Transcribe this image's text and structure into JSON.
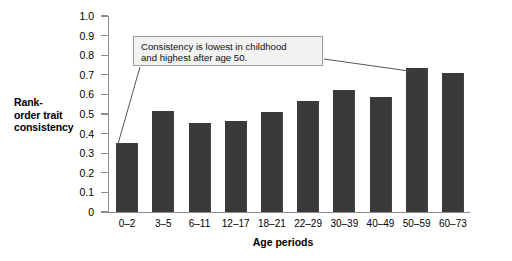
{
  "chart_data": {
    "type": "bar",
    "title": "",
    "xlabel": "Age periods",
    "ylabel": "Rank-order trait consistency",
    "ylabel_lines": [
      "Rank-",
      "order trait",
      "consistency"
    ],
    "categories": [
      "0–2",
      "3–5",
      "6–11",
      "12–17",
      "18–21",
      "22–29",
      "30–39",
      "40–49",
      "50–59",
      "60–73"
    ],
    "values": [
      0.35,
      0.515,
      0.455,
      0.465,
      0.51,
      0.565,
      0.62,
      0.585,
      0.735,
      0.71
    ],
    "ylim": [
      0,
      1.0
    ],
    "ytick_labels": [
      "1.0",
      "0.9",
      "0.8",
      "0.7",
      "0.6",
      "0.5",
      "0.4",
      "0.3",
      "0.2",
      "0.1",
      "0"
    ],
    "ytick_values": [
      1.0,
      0.9,
      0.8,
      0.7,
      0.6,
      0.5,
      0.4,
      0.3,
      0.2,
      0.1,
      0
    ],
    "grid": false,
    "legend": null,
    "bar_color": "#3a3a3a",
    "axis_color": "#8d8d8d",
    "annotations": [
      {
        "text": "Consistency is lowest in childhood and highest after age 50.",
        "lines": [
          "Consistency is lowest in childhood",
          "and highest after age 50."
        ],
        "points_to": [
          "0–2",
          "50–59"
        ]
      }
    ]
  },
  "callout": {
    "line1": "Consistency is lowest in childhood",
    "line2": "and highest after age 50."
  },
  "axis": {
    "xlabel": "Age periods"
  }
}
